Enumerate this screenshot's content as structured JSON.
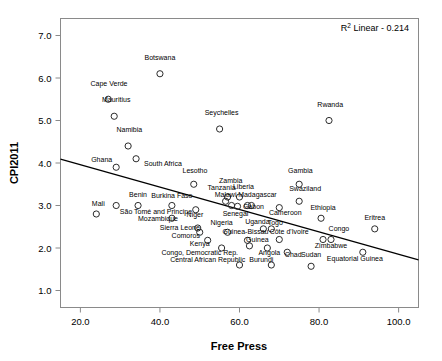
{
  "chart_data": {
    "type": "scatter",
    "title": "",
    "xlabel": "Free Press",
    "ylabel": "CPI2011",
    "xlim": [
      15.0,
      105.0
    ],
    "ylim": [
      0.6,
      7.4
    ],
    "xticks": [
      "20.0",
      "40.0",
      "60.0",
      "80.0",
      "100.0"
    ],
    "xtick_values": [
      20,
      40,
      60,
      80,
      100
    ],
    "yticks": [
      "1.0",
      "2.0",
      "3.0",
      "4.0",
      "5.0",
      "6.0",
      "7.0"
    ],
    "ytick_values": [
      1,
      2,
      3,
      4,
      5,
      6,
      7
    ],
    "grid": false,
    "legend": null,
    "annotation": {
      "text_prefix": "R",
      "text_sup": "2",
      "text_suffix": " Linear - 0.214",
      "full_text": "R2 Linear - 0.214",
      "r_squared": 0.214,
      "position": "top-right"
    },
    "fit_line": {
      "type": "linear",
      "x_start": 15.0,
      "y_start": 4.09,
      "x_end": 105.0,
      "y_end": 1.72
    },
    "points": [
      {
        "label": "Botswana",
        "x": 40.0,
        "y": 6.1,
        "lx": 40.0,
        "ly": 6.42,
        "anchor": "middle"
      },
      {
        "label": "Cape Verde",
        "x": 27.0,
        "y": 5.5,
        "lx": 27.2,
        "ly": 5.82,
        "anchor": "middle"
      },
      {
        "label": "Mauritius",
        "x": 28.5,
        "y": 5.1,
        "lx": 29.0,
        "ly": 5.43,
        "anchor": "middle"
      },
      {
        "label": "Rwanda",
        "x": 82.5,
        "y": 5.0,
        "lx": 82.8,
        "ly": 5.31,
        "anchor": "middle"
      },
      {
        "label": "Seychelles",
        "x": 55.0,
        "y": 4.8,
        "lx": 55.5,
        "ly": 5.12,
        "anchor": "middle"
      },
      {
        "label": "Namibia",
        "x": 32.0,
        "y": 4.4,
        "lx": 32.3,
        "ly": 4.72,
        "anchor": "middle"
      },
      {
        "label": "South Africa",
        "x": 34.0,
        "y": 4.1,
        "lx": 36.0,
        "ly": 3.92,
        "anchor": "start"
      },
      {
        "label": "Ghana",
        "x": 29.0,
        "y": 3.9,
        "lx": 28.0,
        "ly": 4.03,
        "anchor": "end"
      },
      {
        "label": "Lesotho",
        "x": 48.5,
        "y": 3.5,
        "lx": 48.8,
        "ly": 3.76,
        "anchor": "middle"
      },
      {
        "label": "Gambia",
        "x": 75.0,
        "y": 3.5,
        "lx": 75.3,
        "ly": 3.76,
        "anchor": "middle"
      },
      {
        "label": "Zambia",
        "x": 57.0,
        "y": 3.2,
        "lx": 57.8,
        "ly": 3.52,
        "anchor": "middle"
      },
      {
        "label": "Liberia",
        "x": 60.0,
        "y": 3.2,
        "lx": 61.0,
        "ly": 3.38,
        "anchor": "middle"
      },
      {
        "label": "Tanzania",
        "x": 56.5,
        "y": 3.1,
        "lx": 55.5,
        "ly": 3.36,
        "anchor": "middle"
      },
      {
        "label": "Swaziland",
        "x": 75.0,
        "y": 3.1,
        "lx": 76.5,
        "ly": 3.35,
        "anchor": "middle"
      },
      {
        "label": "Malawi",
        "x": 58.0,
        "y": 3.0,
        "lx": 56.5,
        "ly": 3.19,
        "anchor": "middle"
      },
      {
        "label": "Madagascar",
        "x": 63.0,
        "y": 3.0,
        "lx": 64.5,
        "ly": 3.21,
        "anchor": "middle"
      },
      {
        "label": "Burkina Faso",
        "x": 43.0,
        "y": 3.0,
        "lx": 43.0,
        "ly": 3.18,
        "anchor": "middle"
      },
      {
        "label": "Benin",
        "x": 34.5,
        "y": 3.0,
        "lx": 34.5,
        "ly": 3.2,
        "anchor": "middle"
      },
      {
        "label": "Cameroon",
        "x": 70.0,
        "y": 2.95,
        "lx": 71.5,
        "ly": 2.77,
        "anchor": "middle"
      },
      {
        "label": "Niger",
        "x": 49.0,
        "y": 2.9,
        "lx": 48.8,
        "ly": 2.74,
        "anchor": "middle"
      },
      {
        "label": "Senegal",
        "x": 59.5,
        "y": 2.98,
        "lx": 59.0,
        "ly": 2.75,
        "anchor": "middle"
      },
      {
        "label": "Gabon",
        "x": 62.0,
        "y": 3.0,
        "lx": 63.5,
        "ly": 2.92,
        "anchor": "middle"
      },
      {
        "label": "Mali",
        "x": 24.0,
        "y": 2.8,
        "lx": 24.5,
        "ly": 3.0,
        "anchor": "middle"
      },
      {
        "label": "São Tomé and Principe",
        "x": 29.0,
        "y": 3.0,
        "lx": 39.0,
        "ly": 2.8,
        "anchor": "middle"
      },
      {
        "label": "Ethiopia",
        "x": 80.5,
        "y": 2.7,
        "lx": 81.0,
        "ly": 2.9,
        "anchor": "middle"
      },
      {
        "label": "Mozambique",
        "x": 43.0,
        "y": 2.7,
        "lx": 39.5,
        "ly": 2.63,
        "anchor": "middle"
      },
      {
        "label": "Eritrea",
        "x": 94.0,
        "y": 2.45,
        "lx": 94.0,
        "ly": 2.67,
        "anchor": "middle"
      },
      {
        "label": "Togo",
        "x": 68.0,
        "y": 2.45,
        "lx": 69.0,
        "ly": 2.53,
        "anchor": "middle"
      },
      {
        "label": "Uganda",
        "x": 66.0,
        "y": 2.45,
        "lx": 64.5,
        "ly": 2.56,
        "anchor": "middle"
      },
      {
        "label": "Sierra Leone",
        "x": 49.5,
        "y": 2.47,
        "lx": 45.0,
        "ly": 2.43,
        "anchor": "middle"
      },
      {
        "label": "Nigeria",
        "x": 57.0,
        "y": 2.37,
        "lx": 55.5,
        "ly": 2.53,
        "anchor": "middle"
      },
      {
        "label": "Congo",
        "x": 83.0,
        "y": 2.2,
        "lx": 85.0,
        "ly": 2.4,
        "anchor": "middle"
      },
      {
        "label": "Côte d'Ivoire",
        "x": 70.0,
        "y": 2.2,
        "lx": 72.5,
        "ly": 2.32,
        "anchor": "middle"
      },
      {
        "label": "Guinea-Bissau",
        "x": 62.0,
        "y": 2.18,
        "lx": 61.5,
        "ly": 2.32,
        "anchor": "middle"
      },
      {
        "label": "Comoros",
        "x": 50.0,
        "y": 2.37,
        "lx": 46.5,
        "ly": 2.23,
        "anchor": "middle"
      },
      {
        "label": "Guinea",
        "x": 62.5,
        "y": 2.05,
        "lx": 64.5,
        "ly": 2.14,
        "anchor": "middle"
      },
      {
        "label": "Zimbabwe",
        "x": 81.0,
        "y": 2.2,
        "lx": 83.0,
        "ly": 2.0,
        "anchor": "middle"
      },
      {
        "label": "Kenya",
        "x": 52.0,
        "y": 2.18,
        "lx": 50.0,
        "ly": 2.05,
        "anchor": "middle"
      },
      {
        "label": "Congo, Democratic Rep.",
        "x": 55.5,
        "y": 2.0,
        "lx": 50.0,
        "ly": 1.83,
        "anchor": "middle"
      },
      {
        "label": "Angola",
        "x": 67.0,
        "y": 2.0,
        "lx": 67.5,
        "ly": 1.83,
        "anchor": "middle"
      },
      {
        "label": "Chad",
        "x": 72.0,
        "y": 1.9,
        "lx": 73.5,
        "ly": 1.8,
        "anchor": "middle"
      },
      {
        "label": "Equatorial Guinea",
        "x": 91.0,
        "y": 1.9,
        "lx": 89.0,
        "ly": 1.7,
        "anchor": "middle"
      },
      {
        "label": "Sudan",
        "x": 78.0,
        "y": 1.57,
        "lx": 78.0,
        "ly": 1.8,
        "anchor": "middle"
      },
      {
        "label": "Burundi",
        "x": 68.0,
        "y": 1.6,
        "lx": 65.5,
        "ly": 1.67,
        "anchor": "middle"
      },
      {
        "label": "Central African Republic",
        "x": 60.0,
        "y": 1.6,
        "lx": 52.0,
        "ly": 1.67,
        "anchor": "middle"
      }
    ]
  }
}
